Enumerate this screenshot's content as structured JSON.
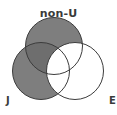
{
  "figure": {
    "type": "venn-diagram",
    "width": 117,
    "height": 115,
    "background_color": "#ffffff"
  },
  "labels": {
    "top": "non-U",
    "left": "J",
    "right": "E",
    "text_color": "#3a3a3a"
  },
  "chart_data": {
    "type": "venn",
    "title": "",
    "set_count": 3,
    "sets": [
      {
        "id": "non-U",
        "label": "non-U",
        "position": "top",
        "cx": 54,
        "cy": 46,
        "r": 28.5,
        "fill": "#7e7e7e",
        "filled": true,
        "stroke": "#3c3c3c",
        "label_x": 54,
        "label_y": 8
      },
      {
        "id": "J",
        "label": "J",
        "position": "bottom-left",
        "cx": 41,
        "cy": 71,
        "r": 28.5,
        "fill": "#7e7e7e",
        "filled": true,
        "stroke": "#3c3c3c",
        "label_x": 6,
        "label_y": 96
      },
      {
        "id": "E",
        "label": "E",
        "position": "bottom-right",
        "cx": 75,
        "cy": 71,
        "r": 28.5,
        "fill": "#ffffff",
        "filled": false,
        "stroke": "#3c3c3c",
        "label_x": 109,
        "label_y": 96
      }
    ],
    "shaded_expression": "(non-U OR J) AND NOT E",
    "regions": [
      {
        "id": "nonU-only",
        "members": [
          "non-U"
        ],
        "shaded": true,
        "fill": "#7e7e7e"
      },
      {
        "id": "J-only",
        "members": [
          "J"
        ],
        "shaded": true,
        "fill": "#7e7e7e"
      },
      {
        "id": "E-only",
        "members": [
          "E"
        ],
        "shaded": false,
        "fill": "#ffffff"
      },
      {
        "id": "nonU-and-J",
        "members": [
          "non-U",
          "J"
        ],
        "shaded": true,
        "fill": "#6e6e6e"
      },
      {
        "id": "nonU-and-E",
        "members": [
          "non-U",
          "E"
        ],
        "shaded": false,
        "fill": "#ffffff"
      },
      {
        "id": "J-and-E",
        "members": [
          "J",
          "E"
        ],
        "shaded": false,
        "fill": "#ffffff"
      },
      {
        "id": "nonU-and-J-and-E",
        "members": [
          "non-U",
          "J",
          "E"
        ],
        "shaded": false,
        "fill": "#ffffff"
      }
    ],
    "colors": {
      "shaded_fill": "#7e7e7e",
      "double_shaded_fill": "#6e6e6e",
      "unshaded_fill": "#ffffff",
      "outline": "#3c3c3c"
    },
    "stroke_width": 1,
    "legend": "none",
    "grid": false
  }
}
